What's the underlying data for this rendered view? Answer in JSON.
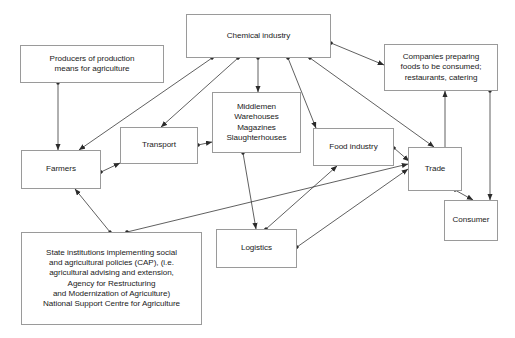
{
  "diagram": {
    "style": {
      "box_border_color": "#9a9a9a",
      "edge_color": "#2b2b2b",
      "background": "#ffffff",
      "text_color": "#1a1a1a"
    },
    "nodes": [
      {
        "id": "chemical",
        "label": "Chemical industry",
        "x": 186,
        "y": 14,
        "w": 145,
        "h": 44
      },
      {
        "id": "producers",
        "label": "Producers of production\nmeans for agriculture",
        "x": 20,
        "y": 45,
        "w": 144,
        "h": 38
      },
      {
        "id": "companies",
        "label": "Companies preparing\nfoods to be consumed;\nrestaurants, catering",
        "x": 384,
        "y": 44,
        "w": 114,
        "h": 47
      },
      {
        "id": "middlemen",
        "label": "Middlemen\nWarehouses\nMagazines\nSlaughterhouses",
        "x": 212,
        "y": 92,
        "w": 89,
        "h": 61
      },
      {
        "id": "transport",
        "label": "Transport",
        "x": 120,
        "y": 127,
        "w": 78,
        "h": 37
      },
      {
        "id": "farmers",
        "label": "Farmers",
        "x": 21,
        "y": 150,
        "w": 80,
        "h": 39
      },
      {
        "id": "food",
        "label": "Food industry",
        "x": 313,
        "y": 128,
        "w": 81,
        "h": 38
      },
      {
        "id": "trade",
        "label": "Trade",
        "x": 408,
        "y": 147,
        "w": 54,
        "h": 44
      },
      {
        "id": "consumer",
        "label": "Consumer",
        "x": 444,
        "y": 200,
        "w": 54,
        "h": 41
      },
      {
        "id": "logistics",
        "label": "Logistics",
        "x": 216,
        "y": 229,
        "w": 81,
        "h": 39
      },
      {
        "id": "state",
        "label": "State institutions implementing social\nand agricultural policies (CAP), (i.e.\nagricultural advising and extension,\nAgency for Restructuring\nand Modernization of Agriculture)\nNational Support Centre for Agriculture",
        "x": 21,
        "y": 232,
        "w": 181,
        "h": 93
      }
    ],
    "edges": [
      {
        "id": "chemical-to-farmers",
        "from": "chemical",
        "to": "farmers",
        "x1": 212,
        "y1": 58,
        "x2": 79,
        "y2": 150,
        "arrow": "end"
      },
      {
        "id": "chemical-to-transport",
        "from": "chemical",
        "to": "transport",
        "x1": 238,
        "y1": 58,
        "x2": 161,
        "y2": 127,
        "arrow": "end"
      },
      {
        "id": "chemical-to-middlemen",
        "from": "chemical",
        "to": "middlemen",
        "x1": 258,
        "y1": 58,
        "x2": 258,
        "y2": 92,
        "arrow": "end"
      },
      {
        "id": "chemical-to-food",
        "from": "chemical",
        "to": "food",
        "x1": 288,
        "y1": 58,
        "x2": 316,
        "y2": 128,
        "arrow": "end"
      },
      {
        "id": "chemical-to-trade",
        "from": "chemical",
        "to": "trade",
        "x1": 310,
        "y1": 58,
        "x2": 434,
        "y2": 147,
        "arrow": "end"
      },
      {
        "id": "chemical-to-companies",
        "from": "chemical",
        "to": "companies",
        "x1": 331,
        "y1": 43,
        "x2": 384,
        "y2": 65,
        "arrow": "end"
      },
      {
        "id": "producers-to-farmers",
        "from": "producers",
        "to": "farmers",
        "x1": 58,
        "y1": 83,
        "x2": 58,
        "y2": 150,
        "arrow": "end"
      },
      {
        "id": "farmers-to-transport",
        "from": "farmers",
        "to": "transport",
        "x1": 101,
        "y1": 172,
        "x2": 120,
        "y2": 163,
        "arrow": "end"
      },
      {
        "id": "transport-to-middlemen",
        "from": "transport",
        "to": "middlemen",
        "x1": 198,
        "y1": 145,
        "x2": 212,
        "y2": 142,
        "arrow": "end"
      },
      {
        "id": "middlemen-to-logistics",
        "from": "middlemen",
        "to": "logistics",
        "x1": 243,
        "y1": 153,
        "x2": 256,
        "y2": 229,
        "arrow": "end"
      },
      {
        "id": "logistics-to-food",
        "from": "logistics",
        "to": "food",
        "x1": 266,
        "y1": 229,
        "x2": 337,
        "y2": 166,
        "arrow": "end"
      },
      {
        "id": "logistics-to-trade",
        "from": "logistics",
        "to": "trade",
        "x1": 297,
        "y1": 247,
        "x2": 408,
        "y2": 169,
        "arrow": "end"
      },
      {
        "id": "food-to-trade",
        "from": "food",
        "to": "trade",
        "x1": 394,
        "y1": 148,
        "x2": 409,
        "y2": 161,
        "arrow": "end"
      },
      {
        "id": "state-to-farmers",
        "from": "state",
        "to": "farmers",
        "x1": 110,
        "y1": 232,
        "x2": 75,
        "y2": 189,
        "arrow": "end"
      },
      {
        "id": "state-to-trade",
        "from": "state",
        "to": "trade",
        "x1": 127,
        "y1": 232,
        "x2": 408,
        "y2": 164,
        "arrow": "end"
      },
      {
        "id": "trade-companies-both",
        "from": "trade",
        "to": "companies",
        "x1": 445,
        "y1": 147,
        "x2": 445,
        "y2": 91,
        "arrow": "both"
      },
      {
        "id": "companies-to-consumer",
        "from": "companies",
        "to": "consumer",
        "x1": 490,
        "y1": 91,
        "x2": 490,
        "y2": 200,
        "arrow": "end"
      },
      {
        "id": "trade-to-consumer",
        "from": "trade",
        "to": "consumer",
        "x1": 455,
        "y1": 190,
        "x2": 473,
        "y2": 200,
        "arrow": "end"
      }
    ]
  }
}
